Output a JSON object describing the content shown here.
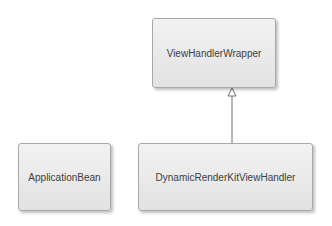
{
  "diagram": {
    "type": "uml-class",
    "nodes": [
      {
        "id": "wrapper",
        "label": "ViewHandlerWrapper"
      },
      {
        "id": "appbean",
        "label": "ApplicationBean"
      },
      {
        "id": "dynamic",
        "label": "DynamicRenderKitViewHandler"
      }
    ],
    "edges": [
      {
        "from": "dynamic",
        "to": "wrapper",
        "kind": "generalization"
      }
    ]
  }
}
